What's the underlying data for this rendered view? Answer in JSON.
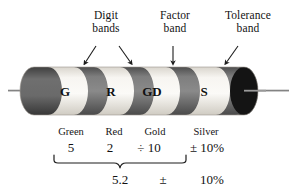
{
  "diagram": {
    "callouts": [
      {
        "id": "digit",
        "line1": "Digit",
        "line2": "bands"
      },
      {
        "id": "factor",
        "line1": "Factor",
        "line2": "band"
      },
      {
        "id": "tolerance",
        "line1": "Tolerance",
        "line2": "band"
      }
    ],
    "resistor": {
      "body_color": "#f4f1ec",
      "band_color": "#6e6e6e",
      "end_cap_color": "#1a1a1a",
      "lead_color": "#8a8a8a",
      "band_letters": [
        {
          "id": "g",
          "label": "G"
        },
        {
          "id": "r",
          "label": "R"
        },
        {
          "id": "gd",
          "label": "GD"
        },
        {
          "id": "s",
          "label": "S"
        }
      ]
    },
    "legend": {
      "color_names": [
        "Green",
        "Red",
        "Gold",
        "Silver"
      ],
      "values": [
        "5",
        "2",
        "÷ 10",
        "± 10%"
      ]
    },
    "result": {
      "value": "5.2",
      "plus_minus": "±",
      "tolerance": "10%"
    }
  }
}
